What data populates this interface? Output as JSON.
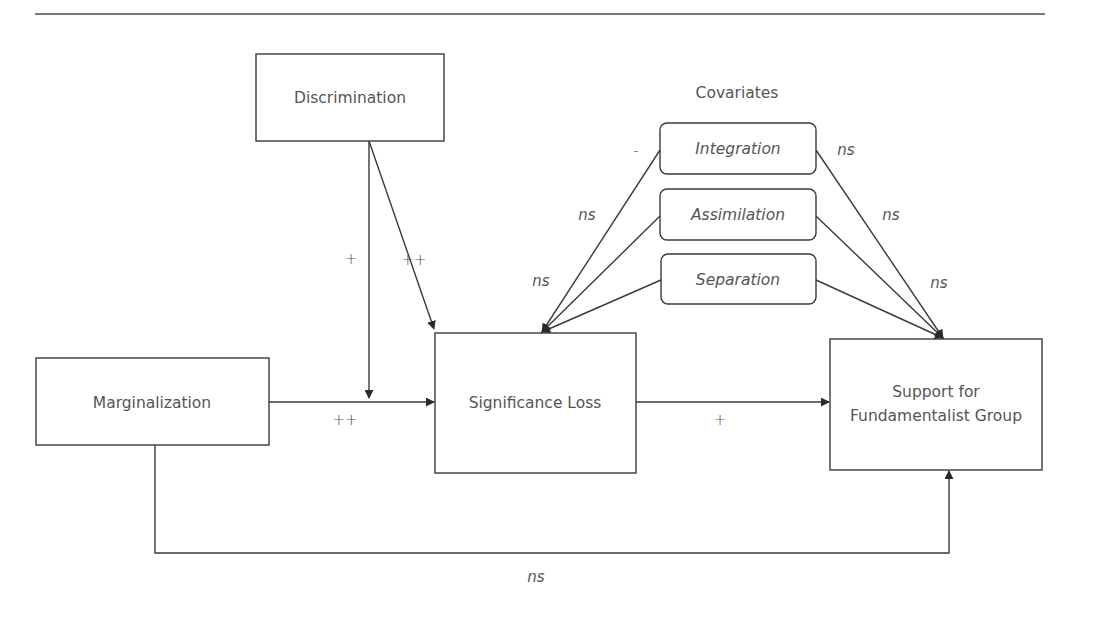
{
  "diagram": {
    "nodes": {
      "discrimination": "Discrimination",
      "marginalization": "Marginalization",
      "significance_loss": "Significance Loss",
      "support_line1": "Support for",
      "support_line2": "Fundamentalist Group",
      "covariates_title": "Covariates",
      "integration": "Integration",
      "assimilation": "Assimilation",
      "separation": "Separation"
    },
    "edges": {
      "discrimination_moderation": "+",
      "discrimination_to_significance": "++",
      "marginalization_to_significance": "++",
      "significance_to_support": "+",
      "marginalization_to_support": "ns",
      "integration_to_significance": "-",
      "assimilation_to_significance": "ns",
      "separation_to_significance": "ns",
      "integration_to_support": "ns",
      "assimilation_to_support": "ns",
      "separation_to_support": "ns"
    }
  }
}
